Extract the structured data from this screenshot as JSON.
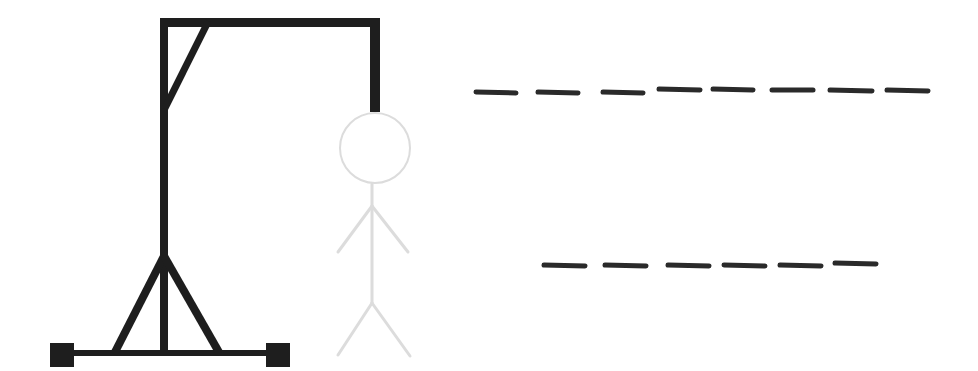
{
  "game": {
    "type": "hangman",
    "colors": {
      "background": "#ffffff",
      "gallows": "#1e1e1e",
      "figure_outline": "#dcdcdc",
      "slot": "#2a2a2a"
    },
    "figure": {
      "parts_shown": [
        "head",
        "body",
        "left-arm",
        "right-arm",
        "left-leg",
        "right-leg"
      ],
      "faded": true
    },
    "word_rows": [
      {
        "slot_count": 8,
        "letters": [
          "",
          "",
          "",
          "",
          "",
          "",
          "",
          ""
        ]
      },
      {
        "slot_count": 6,
        "letters": [
          "",
          "",
          "",
          "",
          "",
          ""
        ]
      }
    ]
  }
}
